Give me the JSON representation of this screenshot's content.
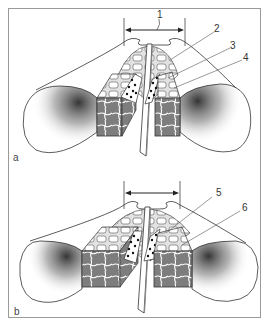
{
  "figure": {
    "panels": [
      {
        "id": "a",
        "label": "a",
        "callouts": [
          {
            "number": "1",
            "target": "width-dimension-arrow"
          },
          {
            "number": "2",
            "target": "upper-cell-layer"
          },
          {
            "number": "3",
            "target": "middle-cell-layer"
          },
          {
            "number": "4",
            "target": "lower-cell-layer"
          }
        ]
      },
      {
        "id": "b",
        "label": "b",
        "callouts": [
          {
            "number": "5",
            "target": "upper-cell-layer"
          },
          {
            "number": "6",
            "target": "lower-cell-layer"
          }
        ]
      }
    ],
    "colors": {
      "line": "#333333",
      "frame": "#9a9a9a",
      "stipple": "#555555",
      "tissue_fill": "#8a8a8a",
      "dot": "#111111"
    }
  }
}
